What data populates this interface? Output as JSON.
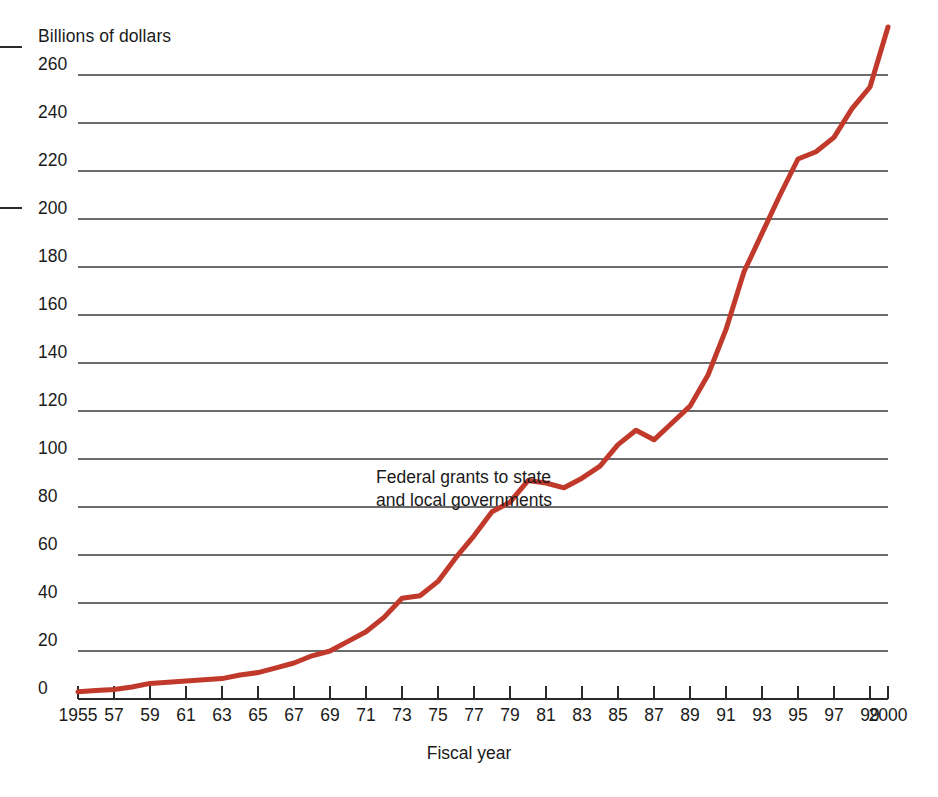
{
  "chart_data": {
    "type": "line",
    "title": "",
    "annotation": "Federal grants to state and local governments",
    "annotation_lines": [
      "Federal grants to state",
      "and local governments"
    ],
    "xlabel": "Fiscal year",
    "ylabel": "Billions of dollars",
    "ylim": [
      0,
      260
    ],
    "xlim": [
      1955,
      2000
    ],
    "yticks": [
      0,
      20,
      40,
      60,
      80,
      100,
      120,
      140,
      160,
      180,
      200,
      220,
      240,
      260
    ],
    "ytick_labels": [
      "0",
      "20",
      "40",
      "60",
      "80",
      "100",
      "120",
      "140",
      "160",
      "180",
      "200",
      "220",
      "240",
      "260"
    ],
    "xticks": [
      1955,
      1957,
      1959,
      1961,
      1963,
      1965,
      1967,
      1969,
      1971,
      1973,
      1975,
      1977,
      1979,
      1981,
      1983,
      1985,
      1987,
      1989,
      1991,
      1993,
      1995,
      1997,
      1999,
      2000
    ],
    "xtick_labels": [
      "1955",
      "57",
      "59",
      "61",
      "63",
      "65",
      "67",
      "69",
      "71",
      "73",
      "75",
      "77",
      "79",
      "81",
      "83",
      "85",
      "87",
      "89",
      "91",
      "93",
      "95",
      "97",
      "99",
      "2000"
    ],
    "grid": "horizontal",
    "legend": "none",
    "line_color": "#C0392B",
    "grid_color": "#3a3a3a",
    "x": [
      1955,
      1956,
      1957,
      1958,
      1959,
      1960,
      1961,
      1962,
      1963,
      1964,
      1965,
      1966,
      1967,
      1968,
      1969,
      1970,
      1971,
      1972,
      1973,
      1974,
      1975,
      1976,
      1977,
      1978,
      1979,
      1980,
      1981,
      1982,
      1983,
      1984,
      1985,
      1986,
      1987,
      1988,
      1989,
      1990,
      1991,
      1992,
      1993,
      1994,
      1995,
      1996,
      1997,
      1998,
      1999,
      2000
    ],
    "values": [
      3,
      3.5,
      4,
      5,
      6.5,
      7,
      7.5,
      8,
      8.5,
      10,
      11,
      13,
      15,
      18,
      20,
      24,
      28,
      34,
      42,
      43,
      49,
      59,
      68,
      78,
      82,
      91,
      90,
      88,
      92,
      97,
      106,
      112,
      108,
      115,
      122,
      135,
      154,
      178,
      194,
      210,
      225,
      228,
      234,
      246,
      255,
      280
    ],
    "notes": [
      "Values estimated from gridline positions; y-axis 20 units per 48 px.",
      "Curve is near zero 1955-1965, accelerates after 1967, plateaus 1980-1982, bumps at 1986 with a dip at 1987, then rises steeply through the 1990s to just above 240 in 2000."
    ]
  },
  "marks": {
    "crop_mark_top": "",
    "crop_mark_bottom": ""
  }
}
